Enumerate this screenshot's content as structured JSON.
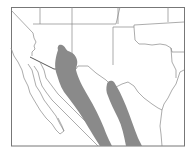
{
  "map": {
    "type": "range-map",
    "region": "Southwestern United States and northern Mexico",
    "colors": {
      "background": "#ffffff",
      "range_fill": "#8a8a8a",
      "lines": "#888888"
    },
    "legend": [],
    "labels": []
  }
}
